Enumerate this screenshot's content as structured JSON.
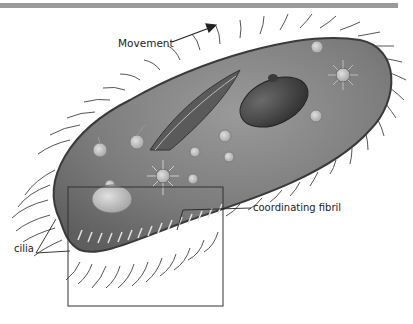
{
  "figure": {
    "labels": {
      "movement": "Movement",
      "cilia": "cilia",
      "coordinating_fibril": "coordinating fibril"
    },
    "colors": {
      "top_bar": "#9a9a9a",
      "body_fill": "#7a7a7a",
      "body_outline": "#3a3a3a",
      "macronucleus": "#3c3c3c",
      "vacuole": "#c8c8c8",
      "leader_line": "#222222"
    },
    "callout_box": {
      "x": 68,
      "y": 187,
      "width": 155,
      "height": 119
    }
  }
}
